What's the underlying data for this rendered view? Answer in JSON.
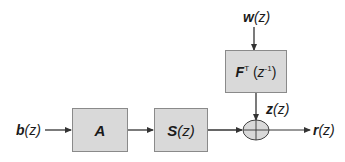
{
  "diagram": {
    "type": "block-diagram",
    "colors": {
      "block_fill": "#d9d9d9",
      "block_border": "#8a8a8a",
      "line": "#333333",
      "text": "#1a1a1a"
    },
    "signals": {
      "input": {
        "symbol": "b",
        "arg": "(z)"
      },
      "noise": {
        "symbol": "w",
        "arg": "(z)"
      },
      "filtered_noise": {
        "symbol": "z",
        "arg": "(z)"
      },
      "output": {
        "symbol": "r",
        "arg": "(z)"
      }
    },
    "blocks": {
      "a": {
        "symbol": "A"
      },
      "s": {
        "symbol": "S",
        "arg": "(z)"
      },
      "f": {
        "symbol": "F",
        "superscript": "T",
        "arg_open": "(",
        "arg_var": "z",
        "arg_exp": "-1",
        "arg_close": ")"
      }
    },
    "summing_junction": {
      "symbol": "+"
    },
    "connections": [
      {
        "from": "b(z)",
        "to": "A"
      },
      {
        "from": "A",
        "to": "S(z)"
      },
      {
        "from": "S(z)",
        "to": "sum"
      },
      {
        "from": "w(z)",
        "to": "F^T(z^-1)"
      },
      {
        "from": "F^T(z^-1)",
        "to": "sum",
        "label": "z(z)"
      },
      {
        "from": "sum",
        "to": "r(z)"
      }
    ]
  }
}
